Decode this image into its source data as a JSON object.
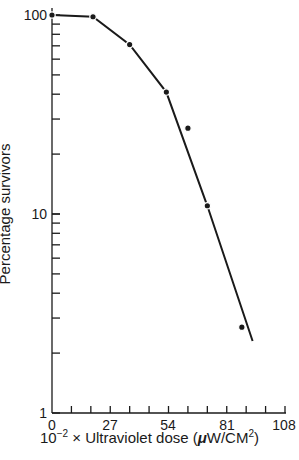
{
  "chart_data": {
    "type": "line",
    "title": "",
    "xlabel": "10^-2 × Ultraviolet dose (μW/CM²)",
    "ylabel": "Percentage survivors",
    "xscale": "linear",
    "yscale": "log",
    "xlim": [
      0,
      108
    ],
    "ylim": [
      1,
      100
    ],
    "x_ticks": [
      0,
      27,
      54,
      81,
      108
    ],
    "x_minor_step": 9,
    "y_ticks": [
      1,
      10,
      100
    ],
    "grid": false,
    "legend": null,
    "series": [
      {
        "name": "Survival curve (points)",
        "x": [
          0,
          19,
          36,
          53,
          63,
          72,
          88
        ],
        "y": [
          100,
          98,
          71,
          41,
          27,
          11,
          2.7
        ]
      },
      {
        "name": "Fitted line",
        "x": [
          0,
          19,
          36,
          53,
          72,
          93
        ],
        "y": [
          100,
          98,
          71,
          41,
          11,
          2.3
        ]
      }
    ]
  },
  "labels": {
    "y_axis": "Percentage survivors",
    "x_axis_prefix": "10",
    "x_axis_exp": "−2",
    "x_axis_mid": " × Ultraviolet dose (",
    "x_axis_mu": "μ",
    "x_axis_unit": "W/CM",
    "x_axis_unit_exp": "2",
    "x_axis_suffix": ")",
    "y_tick_100": "100",
    "y_tick_10": "10",
    "y_tick_1": "1",
    "x_tick_0": "0",
    "x_tick_27": "27",
    "x_tick_54": "54",
    "x_tick_81": "81",
    "x_tick_108": "108"
  }
}
